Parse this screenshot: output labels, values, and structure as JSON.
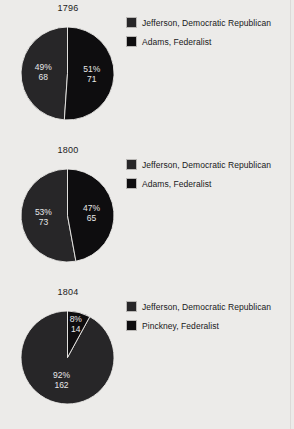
{
  "page": {
    "background_color": "#ecebe9",
    "text_color": "#1c1c1c",
    "label_color": "#e8e8e8"
  },
  "colors": {
    "jefferson": "#272628",
    "adams": "#0e0d0f",
    "pinckney": "#0e0d0f"
  },
  "charts": [
    {
      "title": "1796",
      "legend": [
        {
          "label": "Jefferson, Democratic Republican",
          "color": "#272628"
        },
        {
          "label": "Adams, Federalist",
          "color": "#0e0d0f"
        }
      ],
      "slices": [
        {
          "name": "Jefferson, Democratic Republican",
          "percent": "49%",
          "votes": "68",
          "value": 68,
          "color": "#272628"
        },
        {
          "name": "Adams, Federalist",
          "percent": "51%",
          "votes": "71",
          "value": 71,
          "color": "#0e0d0f"
        }
      ]
    },
    {
      "title": "1800",
      "legend": [
        {
          "label": "Jefferson, Democratic Republican",
          "color": "#272628"
        },
        {
          "label": "Adams, Federalist",
          "color": "#0e0d0f"
        }
      ],
      "slices": [
        {
          "name": "Jefferson, Democratic Republican",
          "percent": "53%",
          "votes": "73",
          "value": 73,
          "color": "#272628"
        },
        {
          "name": "Adams, Federalist",
          "percent": "47%",
          "votes": "65",
          "value": 65,
          "color": "#0e0d0f"
        }
      ]
    },
    {
      "title": "1804",
      "legend": [
        {
          "label": "Jefferson, Democratic Republican",
          "color": "#272628"
        },
        {
          "label": "Pinckney, Federalist",
          "color": "#0e0d0f"
        }
      ],
      "slices": [
        {
          "name": "Jefferson, Democratic Republican",
          "percent": "92%",
          "votes": "162",
          "value": 162,
          "color": "#272628"
        },
        {
          "name": "Pinckney, Federalist",
          "percent": "8%",
          "votes": "14",
          "value": 14,
          "color": "#0e0d0f"
        }
      ]
    }
  ],
  "chart_data": {
    "type": "pie",
    "title": "",
    "panels": [
      {
        "title": "1796",
        "labels": [
          "Jefferson, Democratic Republican",
          "Adams, Federalist"
        ],
        "values": [
          68,
          71
        ],
        "percents": [
          49,
          51
        ],
        "colors": [
          "#272628",
          "#0e0d0f"
        ]
      },
      {
        "title": "1800",
        "labels": [
          "Jefferson, Democratic Republican",
          "Adams, Federalist"
        ],
        "values": [
          73,
          65
        ],
        "percents": [
          53,
          47
        ],
        "colors": [
          "#272628",
          "#0e0d0f"
        ]
      },
      {
        "title": "1804",
        "labels": [
          "Jefferson, Democratic Republican",
          "Pinckney, Federalist"
        ],
        "values": [
          162,
          14
        ],
        "percents": [
          92,
          8
        ],
        "colors": [
          "#272628",
          "#0e0d0f"
        ]
      }
    ],
    "legend_position": "right",
    "grid": false,
    "xlabel": "",
    "ylabel": ""
  }
}
